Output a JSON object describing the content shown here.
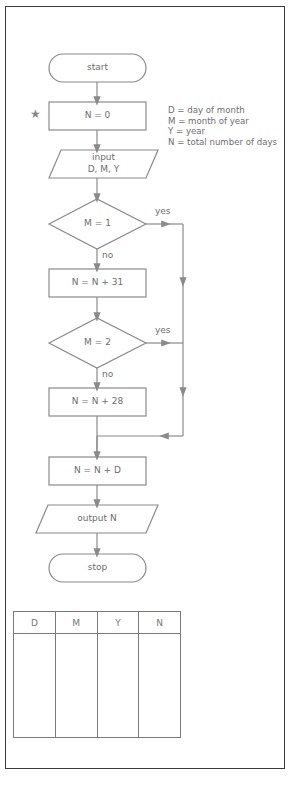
{
  "flowchart": {
    "start": "start",
    "init": "N = 0",
    "input_line1": "input",
    "input_line2": "D, M, Y",
    "decision1": "M = 1",
    "decision1_yes": "yes",
    "decision1_no": "no",
    "process1": "N = N + 31",
    "decision2": "M = 2",
    "decision2_yes": "yes",
    "decision2_no": "no",
    "process2": "N = N + 28",
    "process3": "N = N + D",
    "output": "output N",
    "stop": "stop"
  },
  "marker": {
    "star": "★"
  },
  "legend": {
    "items": [
      "D = day of month",
      "M = month of year",
      "Y = year",
      "N = total number of days"
    ]
  },
  "trace_table": {
    "headers": [
      "D",
      "M",
      "Y",
      "N"
    ],
    "rows": [
      [
        "",
        "",
        "",
        ""
      ]
    ]
  },
  "colors": {
    "line": "#8a8a8a",
    "text": "#6e6e6e",
    "frame": "#3a3a3a"
  }
}
